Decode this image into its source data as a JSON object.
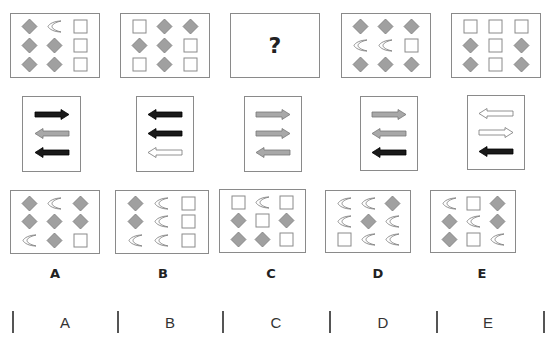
{
  "puzzle": {
    "question_mark": "?",
    "top_row": [
      {
        "id": "t1",
        "cells": [
          "diamond",
          "crescent",
          "square",
          "diamond",
          "diamond",
          "square",
          "diamond",
          "diamond",
          "square"
        ]
      },
      {
        "id": "t2",
        "cells": [
          "square",
          "diamond",
          "diamond",
          "diamond",
          "diamond",
          "square",
          "square",
          "diamond",
          "square"
        ]
      },
      {
        "id": "t3",
        "question": true
      },
      {
        "id": "t4",
        "cells": [
          "diamond",
          "diamond",
          "diamond",
          "crescent",
          "crescent",
          "square",
          "diamond",
          "diamond",
          "diamond"
        ]
      },
      {
        "id": "t5",
        "cells": [
          "square",
          "square",
          "square",
          "diamond",
          "square",
          "diamond",
          "diamond",
          "square",
          "diamond"
        ]
      }
    ],
    "arrow_row": [
      {
        "id": "A",
        "arrows": [
          {
            "dir": "right",
            "color": "black"
          },
          {
            "dir": "left",
            "color": "gray"
          },
          {
            "dir": "left",
            "color": "black"
          }
        ]
      },
      {
        "id": "B",
        "arrows": [
          {
            "dir": "left",
            "color": "black"
          },
          {
            "dir": "left",
            "color": "black"
          },
          {
            "dir": "left",
            "color": "white"
          }
        ]
      },
      {
        "id": "C",
        "arrows": [
          {
            "dir": "right",
            "color": "gray"
          },
          {
            "dir": "right",
            "color": "gray"
          },
          {
            "dir": "left",
            "color": "gray"
          }
        ]
      },
      {
        "id": "D",
        "arrows": [
          {
            "dir": "right",
            "color": "gray"
          },
          {
            "dir": "left",
            "color": "gray"
          },
          {
            "dir": "left",
            "color": "black"
          }
        ]
      },
      {
        "id": "E",
        "arrows": [
          {
            "dir": "left",
            "color": "white"
          },
          {
            "dir": "right",
            "color": "white"
          },
          {
            "dir": "left",
            "color": "black"
          }
        ]
      }
    ],
    "options": [
      {
        "label": "A",
        "cells": [
          "diamond",
          "crescent",
          "diamond",
          "diamond",
          "diamond",
          "diamond",
          "crescent",
          "diamond",
          "square"
        ]
      },
      {
        "label": "B",
        "cells": [
          "diamond",
          "crescent",
          "square",
          "diamond",
          "crescent",
          "square",
          "crescent",
          "crescent",
          "square"
        ]
      },
      {
        "label": "C",
        "cells": [
          "square",
          "crescent",
          "square",
          "diamond",
          "square",
          "diamond",
          "diamond",
          "diamond",
          "square"
        ]
      },
      {
        "label": "D",
        "cells": [
          "crescent",
          "crescent",
          "diamond",
          "crescent",
          "diamond",
          "crescent",
          "square",
          "crescent",
          "crescent"
        ]
      },
      {
        "label": "E",
        "cells": [
          "crescent",
          "square",
          "diamond",
          "diamond",
          "crescent",
          "diamond",
          "diamond",
          "square",
          "crescent"
        ]
      }
    ]
  },
  "answer_bar": {
    "labels": [
      "A",
      "B",
      "C",
      "D",
      "E"
    ]
  },
  "colors": {
    "diamond_fill": "#a0a0a0",
    "diamond_stroke": "#7a7a7a",
    "outline": "#8a8a8a",
    "arrow_black": "#1a1a1a",
    "arrow_gray": "#a8a8a8",
    "arrow_white": "#ffffff"
  }
}
